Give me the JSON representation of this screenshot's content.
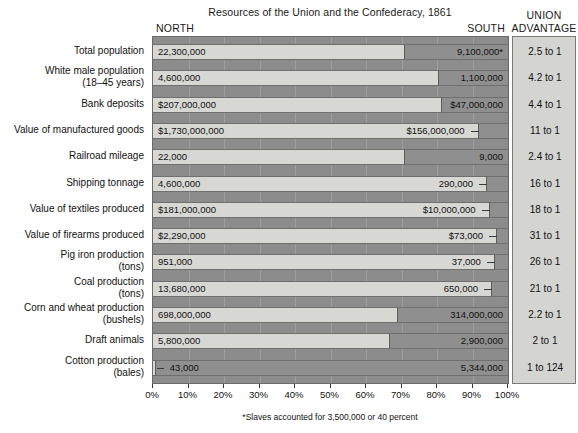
{
  "header": {
    "title": "Resources of the Union and the Confederacy, 1861",
    "north_label": "NORTH",
    "south_label": "SOUTH",
    "union_label": "UNION",
    "advantage_label": "ADVANTAGE"
  },
  "footnote": "*Slaves accounted for 3,500,000 or 40 percent",
  "colors": {
    "north_bar": "#d7d7d4",
    "south_bar": "#8f8f8f",
    "plot_background": "#8c8c8c",
    "advantage_background": "#d4d4d1",
    "text": "#111111"
  },
  "chart_data": {
    "type": "bar",
    "orientation": "horizontal",
    "stacked": "percent",
    "title": "Resources of the Union and the Confederacy, 1861",
    "xlabel": "",
    "ylabel": "",
    "xlim": [
      0,
      100
    ],
    "grid": true,
    "legend_position": "top",
    "x_ticks": [
      "0%",
      "10%",
      "20%",
      "30%",
      "40%",
      "50%",
      "60%",
      "70%",
      "80%",
      "90%",
      "100%"
    ],
    "x_tick_values": [
      0,
      10,
      20,
      30,
      40,
      50,
      60,
      70,
      80,
      90,
      100
    ],
    "series": [
      {
        "name": "NORTH",
        "color": "#d7d7d4"
      },
      {
        "name": "SOUTH",
        "color": "#8f8f8f"
      }
    ],
    "categories": [
      "Total population",
      "White male population\n(18–45 years)",
      "Bank deposits",
      "Value of manufactured goods",
      "Railroad mileage",
      "Shipping tonnage",
      "Value of textiles produced",
      "Value of firearms produced",
      "Pig iron production\n(tons)",
      "Coal production\n(tons)",
      "Corn and wheat production\n(bushels)",
      "Draft animals",
      "Cotton production\n(bales)"
    ],
    "rows": [
      {
        "category": "Total population",
        "north_label": "22,300,000",
        "south_label": "9,100,000*",
        "advantage": "2.5 to 1",
        "north_pct": 71.0,
        "south_pct": 29.0,
        "south_leader": false,
        "north_leader": false
      },
      {
        "category": "White male population\n(18–45 years)",
        "north_label": "4,600,000",
        "south_label": "1,100,000",
        "advantage": "4.2 to 1",
        "north_pct": 80.7,
        "south_pct": 19.3,
        "south_leader": false,
        "north_leader": false
      },
      {
        "category": "Bank deposits",
        "north_label": "$207,000,000",
        "south_label": "$47,000,000",
        "advantage": "4.4 to 1",
        "north_pct": 81.5,
        "south_pct": 18.5,
        "south_leader": false,
        "north_leader": false
      },
      {
        "category": "Value of manufactured goods",
        "north_label": "$1,730,000,000",
        "south_label": "$156,000,000",
        "advantage": "11 to 1",
        "north_pct": 91.7,
        "south_pct": 8.3,
        "south_leader": true,
        "north_leader": false
      },
      {
        "category": "Railroad mileage",
        "north_label": "22,000",
        "south_label": "9,000",
        "advantage": "2.4 to 1",
        "north_pct": 71.0,
        "south_pct": 29.0,
        "south_leader": false,
        "north_leader": false
      },
      {
        "category": "Shipping tonnage",
        "north_label": "4,600,000",
        "south_label": "290,000",
        "advantage": "16 to 1",
        "north_pct": 94.1,
        "south_pct": 5.9,
        "south_leader": true,
        "north_leader": false
      },
      {
        "category": "Value of textiles produced",
        "north_label": "$181,000,000",
        "south_label": "$10,000,000",
        "advantage": "18 to 1",
        "north_pct": 94.8,
        "south_pct": 5.2,
        "south_leader": true,
        "north_leader": false
      },
      {
        "category": "Value of firearms produced",
        "north_label": "$2,290,000",
        "south_label": "$73,000",
        "advantage": "31 to 1",
        "north_pct": 96.9,
        "south_pct": 3.1,
        "south_leader": true,
        "north_leader": false
      },
      {
        "category": "Pig iron production\n(tons)",
        "north_label": "951,000",
        "south_label": "37,000",
        "advantage": "26 to 1",
        "north_pct": 96.3,
        "south_pct": 3.7,
        "south_leader": true,
        "north_leader": false
      },
      {
        "category": "Coal production\n(tons)",
        "north_label": "13,680,000",
        "south_label": "650,000",
        "advantage": "21 to 1",
        "north_pct": 95.5,
        "south_pct": 4.5,
        "south_leader": true,
        "north_leader": false
      },
      {
        "category": "Corn and wheat production\n(bushels)",
        "north_label": "698,000,000",
        "south_label": "314,000,000",
        "advantage": "2.2 to 1",
        "north_pct": 69.0,
        "south_pct": 31.0,
        "south_leader": false,
        "north_leader": false
      },
      {
        "category": "Draft animals",
        "north_label": "5,800,000",
        "south_label": "2,900,000",
        "advantage": "2 to 1",
        "north_pct": 66.7,
        "south_pct": 33.3,
        "south_leader": false,
        "north_leader": false
      },
      {
        "category": "Cotton production\n(bales)",
        "north_label": "43,000",
        "south_label": "5,344,000",
        "advantage": "1 to 124",
        "north_pct": 0.8,
        "south_pct": 99.2,
        "south_leader": false,
        "north_leader": true
      }
    ]
  }
}
